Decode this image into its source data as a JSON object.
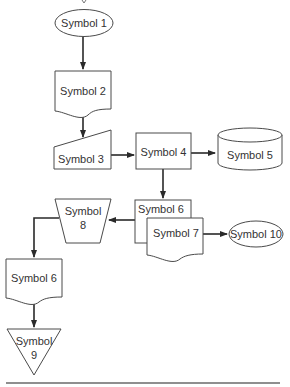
{
  "diagram": {
    "title_partial": "",
    "nodes": [
      {
        "id": "symbol1",
        "label": "Symbol 1",
        "shape": "ellipse"
      },
      {
        "id": "symbol2",
        "label": "Symbol 2",
        "shape": "document"
      },
      {
        "id": "symbol3",
        "label": "Symbol 3",
        "shape": "manual-input"
      },
      {
        "id": "symbol4",
        "label": "Symbol 4",
        "shape": "process"
      },
      {
        "id": "symbol5",
        "label": "Symbol 5",
        "shape": "cylinder"
      },
      {
        "id": "symbol6a",
        "label": "Symbol 6",
        "shape": "document-back"
      },
      {
        "id": "symbol7",
        "label": "Symbol 7",
        "shape": "document"
      },
      {
        "id": "symbol8",
        "label_line1": "Symbol",
        "label_line2": "8",
        "shape": "manual-operation"
      },
      {
        "id": "symbol10",
        "label": "Symbol 10",
        "shape": "ellipse"
      },
      {
        "id": "symbol6b",
        "label": "Symbol 6",
        "shape": "document"
      },
      {
        "id": "symbol9",
        "label_line1": "Symbol",
        "label_line2": "9",
        "shape": "inverted-triangle"
      }
    ],
    "edges": [
      {
        "from": "Symbol 1",
        "to": "Symbol 2"
      },
      {
        "from": "Symbol 2",
        "to": "Symbol 3"
      },
      {
        "from": "Symbol 3",
        "to": "Symbol 4"
      },
      {
        "from": "Symbol 4",
        "to": "Symbol 5"
      },
      {
        "from": "Symbol 4",
        "to": "Symbol 6"
      },
      {
        "from": "Symbol 6",
        "to": "Symbol 8"
      },
      {
        "from": "Symbol 7",
        "to": "Symbol 10"
      },
      {
        "from": "Symbol 8",
        "to": "Symbol 6"
      },
      {
        "from": "Symbol 6",
        "to": "Symbol 9"
      }
    ],
    "colors": {
      "stroke": "#4a4a4a",
      "edge": "#2a2a2a",
      "text": "#333333",
      "background": "#ffffff"
    }
  }
}
